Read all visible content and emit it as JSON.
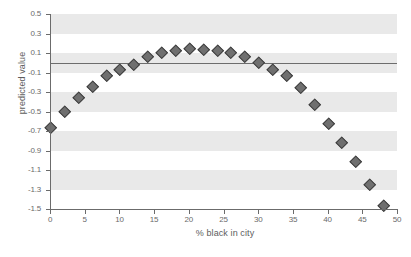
{
  "chart_data": {
    "type": "scatter",
    "title": "",
    "xlabel": "% black in city",
    "ylabel": "predicted value",
    "xlim": [
      0,
      50
    ],
    "ylim": [
      -1.5,
      0.5
    ],
    "xticks": [
      0,
      5,
      10,
      15,
      20,
      25,
      30,
      35,
      40,
      45,
      50
    ],
    "xtick_labels": [
      "0",
      "5",
      "10",
      "15",
      "20",
      "25",
      "30",
      "35",
      "40",
      "45",
      "50"
    ],
    "yticks": [
      0.5,
      0.3,
      0.1,
      -0.1,
      -0.3,
      -0.5,
      -0.7,
      -0.9,
      -1.1,
      -1.3,
      -1.5
    ],
    "ytick_labels": [
      "0.5",
      "0.3",
      "0.1",
      "-0.1",
      "-0.3",
      "-0.5",
      "-0.7",
      "-0.9",
      "-1.1",
      "-1.3",
      "-1.5"
    ],
    "grid": false,
    "banding": {
      "color": "#e9e9e9",
      "bands": [
        [
          0.5,
          0.3
        ],
        [
          0.1,
          -0.1
        ],
        [
          -0.3,
          -0.5
        ],
        [
          -0.7,
          -0.9
        ],
        [
          -1.1,
          -1.3
        ]
      ]
    },
    "reference_line": {
      "y": 0.0,
      "color": "#6d6d6d"
    },
    "marker": {
      "shape": "diamond",
      "color": "#6f6f6f",
      "edge_color": "#3d3d3d",
      "size": 7
    },
    "x": [
      0,
      2,
      4,
      6,
      8,
      10,
      12,
      14,
      16,
      18,
      20,
      22,
      24,
      26,
      28,
      30,
      32,
      34,
      36,
      38,
      40,
      42,
      44,
      46,
      48
    ],
    "values": [
      -0.66,
      -0.49,
      -0.35,
      -0.24,
      -0.13,
      -0.06,
      -0.01,
      0.07,
      0.11,
      0.13,
      0.15,
      0.14,
      0.13,
      0.11,
      0.07,
      0.01,
      -0.06,
      -0.13,
      -0.25,
      -0.42,
      -0.62,
      -0.81,
      -1.01,
      -1.24,
      -1.46
    ]
  }
}
